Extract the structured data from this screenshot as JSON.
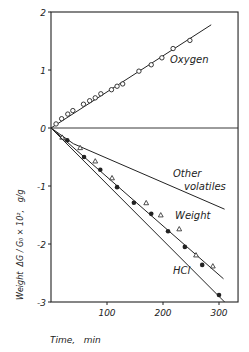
{
  "chart_data": {
    "type": "line",
    "title": "",
    "xlabel": "Time,   min",
    "ylabel": "Weight  ΔG / G₀ × 10²,   g/g",
    "xlim": [
      0,
      334
    ],
    "ylim": [
      -3,
      2
    ],
    "x_ticks": [
      100,
      200,
      300
    ],
    "y_ticks": [
      2,
      1,
      0,
      -1,
      -2,
      -3
    ],
    "x_tick_labels": [
      "100",
      "200",
      "300"
    ],
    "y_tick_labels": [
      "2",
      "1",
      "0",
      "-1",
      "-2",
      "-3"
    ],
    "grid": false,
    "zero_line": true,
    "legend": "inline labels",
    "series": [
      {
        "name": "Oxygen",
        "marker": "open-circle",
        "label_pos": [
          205,
          1.15
        ],
        "fit_line": [
          [
            0,
            0
          ],
          [
            286,
            1.78
          ]
        ],
        "points": [
          [
            9,
            0.07
          ],
          [
            19,
            0.16
          ],
          [
            30,
            0.24
          ],
          [
            39,
            0.3
          ],
          [
            58,
            0.41
          ],
          [
            69,
            0.47
          ],
          [
            79,
            0.52
          ],
          [
            89,
            0.59
          ],
          [
            108,
            0.66
          ],
          [
            118,
            0.72
          ],
          [
            128,
            0.76
          ],
          [
            157,
            0.98
          ],
          [
            179,
            1.09
          ],
          [
            198,
            1.21
          ],
          [
            218,
            1.37
          ],
          [
            248,
            1.51
          ]
        ]
      },
      {
        "name": "Other volatiles",
        "marker": "none",
        "label_pos": [
          210,
          -0.45
        ],
        "label_lines": [
          "Other",
          "volatiles"
        ],
        "fit_line": [
          [
            0,
            0
          ],
          [
            40,
            -0.27
          ],
          [
            310,
            -1.4
          ]
        ],
        "points": []
      },
      {
        "name": "Weight",
        "marker": "open-triangle",
        "label_pos": [
          190,
          -1.35
        ],
        "fit_line": [
          [
            0,
            0
          ],
          [
            308,
            -2.6
          ]
        ],
        "points": [
          [
            20,
            -0.16
          ],
          [
            52,
            -0.34
          ],
          [
            79,
            -0.57
          ],
          [
            109,
            -0.86
          ],
          [
            170,
            -1.29
          ],
          [
            196,
            -1.5
          ],
          [
            229,
            -1.74
          ],
          [
            259,
            -2.19
          ],
          [
            289,
            -2.38
          ]
        ]
      },
      {
        "name": "HCl",
        "marker": "filled-circle",
        "label_pos": [
          175,
          -2.2
        ],
        "fit_line": [
          [
            0,
            0
          ],
          [
            310,
            -3.0
          ]
        ],
        "points": [
          [
            29,
            -0.21
          ],
          [
            59,
            -0.5
          ],
          [
            88,
            -0.72
          ],
          [
            118,
            -1.02
          ],
          [
            148,
            -1.29
          ],
          [
            179,
            -1.48
          ],
          [
            209,
            -1.78
          ],
          [
            239,
            -2.05
          ],
          [
            270,
            -2.36
          ],
          [
            300,
            -2.88
          ]
        ]
      }
    ]
  },
  "labels": {
    "oxygen": "Oxygen",
    "other_1": "Other",
    "other_2": "volatiles",
    "weight": "Weight",
    "hcl": "HCl",
    "xlabel": "Time,   min",
    "ylabel": "Weight  ΔG / G₀ × 10²,   g/g"
  },
  "colors": {
    "ink": "#222222",
    "background": "#ffffff"
  }
}
